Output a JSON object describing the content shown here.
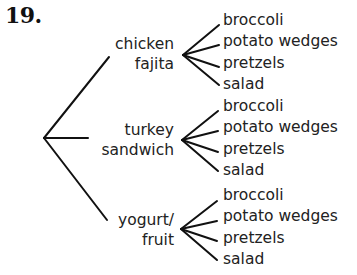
{
  "problem_number": "19.",
  "tree": {
    "branches": [
      {
        "line1": "chicken",
        "line2": "fajita",
        "leaves": [
          "broccoli",
          "potato wedges",
          "pretzels",
          "salad"
        ]
      },
      {
        "line1": "turkey",
        "line2": "sandwich",
        "leaves": [
          "broccoli",
          "potato wedges",
          "pretzels",
          "salad"
        ]
      },
      {
        "line1": "yogurt/",
        "line2": "fruit",
        "leaves": [
          "broccoli",
          "potato wedges",
          "pretzels",
          "salad"
        ]
      }
    ]
  }
}
